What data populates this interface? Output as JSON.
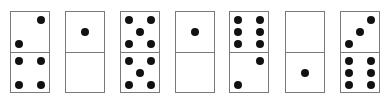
{
  "dominoes": [
    {
      "left": 10,
      "top": 2,
      "bottom": 4
    },
    {
      "left": 65,
      "top": 1,
      "bottom": 0
    },
    {
      "left": 120,
      "top": 5,
      "bottom": 5
    },
    {
      "left": 175,
      "top": 1,
      "bottom": 0
    },
    {
      "left": 229,
      "top": 6,
      "bottom": 2
    },
    {
      "left": 285,
      "top": 0,
      "bottom": 1
    },
    {
      "left": 340,
      "top": 3,
      "bottom": 6
    }
  ],
  "colors": {
    "border": "#7a7a7a",
    "pip": "#111111",
    "background": "#ffffff"
  }
}
